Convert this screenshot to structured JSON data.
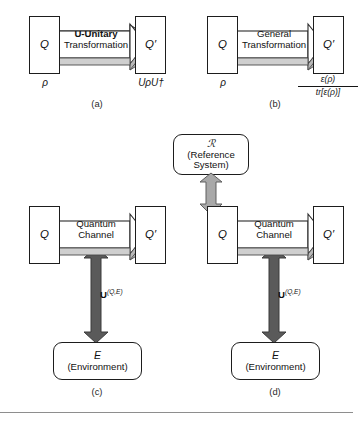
{
  "figure": {
    "panels": [
      {
        "id": "a",
        "caption": "(a)",
        "left_system": "Q",
        "right_system": "Q′",
        "channel_line1": "U-Unitary",
        "channel_line2": "Transformation",
        "channel_bold_prefix": "U",
        "left_state": "ρ",
        "right_state": "UρU†"
      },
      {
        "id": "b",
        "caption": "(b)",
        "left_system": "Q",
        "right_system": "Q′",
        "channel_line1": "General",
        "channel_line2": "Transformation",
        "left_state": "ρ",
        "right_state_numerator": "ε(ρ)",
        "right_state_denominator": "tr[ε(ρ)]"
      },
      {
        "id": "c",
        "caption": "(c)",
        "left_system": "Q",
        "right_system": "Q′",
        "channel_line1": "Quantum",
        "channel_line2": "Channel",
        "unitary_label": "U",
        "unitary_superscript": "(Q,E)",
        "environment_symbol": "E",
        "environment_name": "(Environment)"
      },
      {
        "id": "d",
        "caption": "(d)",
        "left_system": "Q",
        "right_system": "Q′",
        "channel_line1": "Quantum",
        "channel_line2": "Channel",
        "unitary_label": "U",
        "unitary_superscript": "(Q,E)",
        "environment_symbol": "E",
        "environment_name": "(Environment)",
        "reference_symbol": "ℛ",
        "reference_name_line1": "(Reference",
        "reference_name_line2": "System)"
      }
    ],
    "colors": {
      "stroke": "#1d1d1d",
      "box_fill": "#ffffff",
      "channel_fill": "#ffffff",
      "channel_shadow": "#b8b8b8",
      "arrow_light": "#a8a8a8",
      "arrow_dark": "#5a5a5a",
      "rule": "#8e8e8e"
    }
  }
}
